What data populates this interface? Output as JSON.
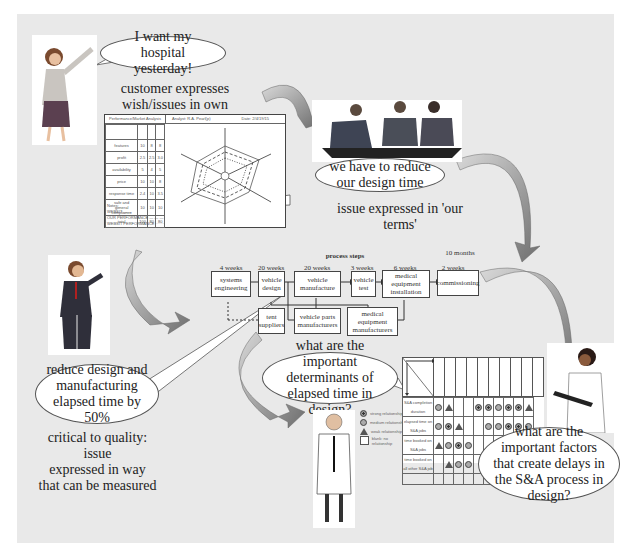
{
  "bubbles": {
    "customer": "I want my hospital yesterday!",
    "team": "we have to reduce our design time",
    "ctq": "reduce design and manufacturing elapsed time by 50%",
    "determinants": "what are the important determinants of elapsed time in design?",
    "factors": "what are the important factors that create delays in the S&A process in design?"
  },
  "captions": {
    "customer_terms_1": "customer expresses",
    "customer_terms_2": "wish/issues in own terms",
    "our_terms": "issue expressed in 'our terms'",
    "ctq_1": "critical to quality: issue",
    "ctq_2": "expressed in way",
    "ctq_3": "that can be measured"
  },
  "process": {
    "title": "process steps",
    "total": "10 months",
    "steps": [
      {
        "label": "systems engineering",
        "duration": "4 weeks"
      },
      {
        "label": "vehicle design",
        "duration": "20 weeks"
      },
      {
        "label": "vehicle manufacture",
        "duration": "20 weeks"
      },
      {
        "label": "vehicle test",
        "duration": "3 weeks"
      },
      {
        "label": "medical equipment installation",
        "duration": "6 weeks"
      },
      {
        "label": "commissioning",
        "duration": "2 weeks"
      }
    ],
    "suppliers": [
      {
        "label": "tent suppliers"
      },
      {
        "label": "vehicle parts manufacturers"
      },
      {
        "label": "medical equipment manufacturers"
      }
    ]
  },
  "analysis_sheet": {
    "title": "Performance/Market Analysis",
    "analyst_label": "Analyst:",
    "analyst": "R.A. Pearl(p)",
    "date_label": "Date:",
    "date": "2/4/19/15",
    "rows": [
      "features",
      "profit",
      "availability",
      "price",
      "response time",
      "safe and general compliance",
      "total"
    ],
    "notes": [
      "Notes:",
      "WEBSIT ——",
      "OUR PERFORMANCE — — —",
      "WEBSIT PERFORMANCE ·······"
    ],
    "radar_labels": [
      "features",
      "profit",
      "availability",
      "price",
      "response time",
      "safe and general compliance"
    ]
  },
  "matrix": {
    "rows": [
      "S&A completion duration",
      "elapsed time on S&A jobs",
      "time booked on S&A jobs",
      "time booked on all other S&A job"
    ],
    "legend": [
      "strong relationship",
      "medium relationship",
      "weak relationship",
      "blank: no relationship"
    ],
    "cells": [
      [
        "medium",
        "weak",
        "",
        "",
        "strong",
        "strong",
        "medium",
        "strong",
        "strong",
        "weak"
      ],
      [
        "medium",
        "strong",
        "weak",
        "",
        "",
        "medium",
        "medium",
        "strong",
        "strong",
        "medium"
      ],
      [
        "weak",
        "medium",
        "strong",
        "medium",
        "",
        "",
        "",
        "",
        "",
        ""
      ],
      [
        "",
        "weak",
        "medium",
        "medium",
        "",
        "",
        "",
        "",
        "",
        ""
      ]
    ]
  },
  "colors": {
    "panel": "#e9e9e9",
    "arrow_dark": "#6f6f6f",
    "arrow_light": "#d8d8d8"
  }
}
